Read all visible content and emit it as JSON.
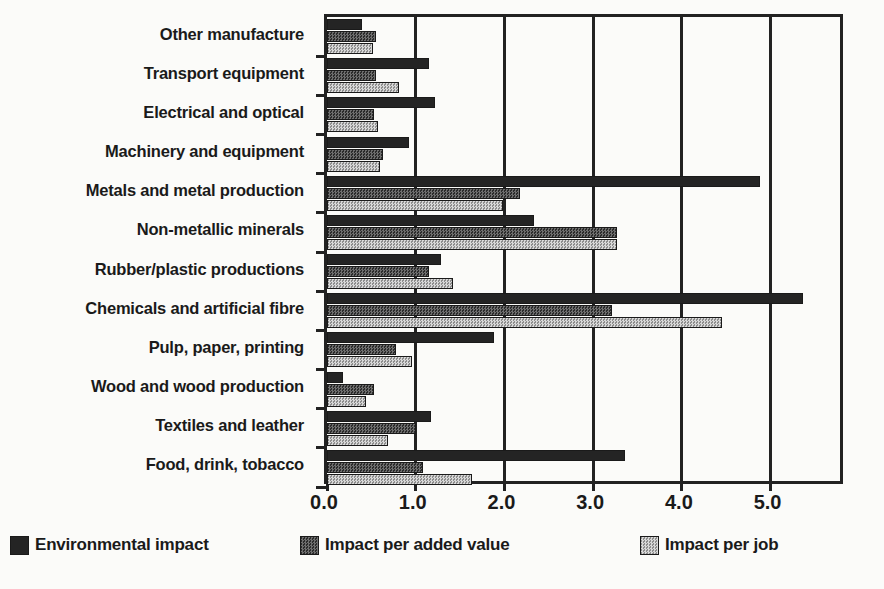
{
  "chart_data": {
    "type": "bar",
    "orientation": "horizontal",
    "title": "",
    "xlabel": "",
    "ylabel": "",
    "xlim": [
      0.0,
      5.85
    ],
    "xticks": [
      0.0,
      1.0,
      2.0,
      3.0,
      4.0,
      5.0
    ],
    "xtick_labels": [
      "0.0",
      "1.0",
      "2.0",
      "3.0",
      "4.0",
      "5.0"
    ],
    "grid": "vertical",
    "legend_position": "bottom",
    "categories": [
      "Food, drink, tobacco",
      "Textiles and leather",
      "Wood and wood production",
      "Pulp, paper, printing",
      "Chemicals and artificial fibre",
      "Rubber/plastic productions",
      "Non-metallic minerals",
      "Metals and metal production",
      "Machinery and equipment",
      "Electrical and optical",
      "Transport equipment",
      "Other manufacture"
    ],
    "series": [
      {
        "name": "Environmental impact",
        "color": "#242424",
        "values": [
          3.36,
          1.17,
          0.18,
          1.88,
          5.36,
          1.28,
          2.33,
          4.88,
          0.92,
          1.22,
          1.15,
          0.39
        ]
      },
      {
        "name": "Impact per added value",
        "color": "#4a4a4a",
        "values": [
          1.08,
          1.0,
          0.53,
          0.78,
          3.21,
          1.15,
          3.27,
          2.18,
          0.63,
          0.53,
          0.55,
          0.55
        ]
      },
      {
        "name": "Impact per job",
        "color": "#bdbdbd",
        "values": [
          1.64,
          0.69,
          0.44,
          0.96,
          4.45,
          1.42,
          3.27,
          1.98,
          0.6,
          0.58,
          0.81,
          0.52
        ]
      }
    ]
  },
  "legend": {
    "items": [
      {
        "label": "Environmental impact",
        "swatch": "dark-solid-swatch"
      },
      {
        "label": "Impact per added value",
        "swatch": "medium-hatch-swatch"
      },
      {
        "label": "Impact per job",
        "swatch": "light-hatch-swatch"
      }
    ]
  }
}
